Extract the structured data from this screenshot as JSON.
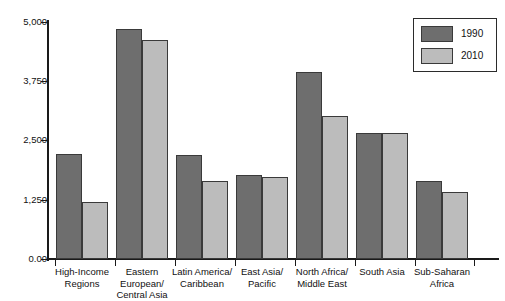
{
  "chart_data": {
    "type": "bar",
    "title": "",
    "subtitle": "",
    "xlabel": "",
    "ylabel": "",
    "ylim": [
      0,
      5000
    ],
    "grid": false,
    "legend_position": "top-right",
    "ytick_labels": [
      "5,000",
      "3,750",
      "2,500",
      "1,250",
      "0.00"
    ],
    "ytick_values": [
      5000,
      3750,
      2500,
      1250,
      0
    ],
    "categories": [
      "High-Income\nRegions",
      "Eastern European/\nCentral Asia",
      "Latin America/\nCaribbean",
      "East Asia/\nPacific",
      "North Africa/\nMiddle East",
      "South Asia",
      "Sub-Saharan\nAfrica"
    ],
    "category_lines": [
      [
        "High-Income",
        "Regions"
      ],
      [
        "Eastern European/",
        "Central Asia"
      ],
      [
        "Latin America/",
        "Caribbean"
      ],
      [
        "East Asia/",
        "Pacific"
      ],
      [
        "North Africa/",
        "Middle East"
      ],
      [
        "South Asia"
      ],
      [
        "Sub-Saharan",
        "Africa"
      ]
    ],
    "series": [
      {
        "name": "1990",
        "color": "#6e6e6e",
        "values": [
          2210,
          4850,
          2190,
          1780,
          3940,
          2660,
          1650
        ]
      },
      {
        "name": "2010",
        "color": "#bcbcbc",
        "values": [
          1200,
          4620,
          1650,
          1730,
          3010,
          2660,
          1410
        ]
      }
    ]
  },
  "legend": {
    "entries": [
      {
        "label": "1990",
        "swatch": "#6e6e6e"
      },
      {
        "label": "2010",
        "swatch": "#bcbcbc"
      }
    ]
  }
}
